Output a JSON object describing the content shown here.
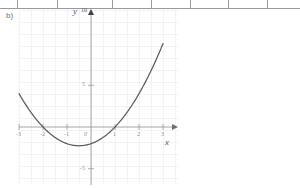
{
  "figure": {
    "part_label": "b)",
    "background_color": "#ffffff",
    "curve_color": "#5a5a62",
    "axis_color": "#9a9a9e",
    "grid_color": "#f2f2f5",
    "text_color": "#8b8b93"
  },
  "ruler": {
    "name": "page-ruler-strip",
    "tick_positions_px": [
      17,
      57,
      112,
      151,
      190,
      228,
      267
    ]
  },
  "axis_labels": {
    "x_name": "x",
    "y_name": "y",
    "y_max_label": "10",
    "origin_label": "0"
  },
  "chart_data": {
    "type": "line",
    "title": "b)",
    "xlabel": "x",
    "ylabel": "y",
    "xlim": [
      -3,
      3
    ],
    "ylim": [
      -5,
      10
    ],
    "grid": true,
    "legend": "none",
    "x_ticks": [
      -3,
      -2,
      -1,
      0,
      1,
      2,
      3
    ],
    "x_tick_labels": [
      "-3",
      "-2",
      "-1",
      "0",
      "1",
      "2",
      "3"
    ],
    "y_ticks": [
      -5,
      5,
      10
    ],
    "y_tick_labels": [
      "-5",
      "5",
      "10"
    ],
    "series": [
      {
        "name": "y = x^2 + x - 2",
        "equation": "y = x^2 + x - 2",
        "roots": [
          -2,
          1
        ],
        "vertex": [
          -0.5,
          -2.25
        ],
        "y_intercept": -2,
        "x": [
          -3.0,
          -2.75,
          -2.5,
          -2.25,
          -2.0,
          -1.75,
          -1.5,
          -1.25,
          -1.0,
          -0.75,
          -0.5,
          -0.25,
          0.0,
          0.25,
          0.5,
          0.75,
          1.0,
          1.25,
          1.5,
          1.75,
          2.0,
          2.25,
          2.5,
          2.75,
          3.0
        ],
        "y": [
          4.0,
          3.19,
          2.75,
          1.81,
          0.0,
          -0.69,
          -1.25,
          -1.69,
          -2.0,
          -2.19,
          -2.25,
          -2.19,
          -2.0,
          -1.69,
          -1.25,
          -0.69,
          0.0,
          0.81,
          1.75,
          2.81,
          4.0,
          5.31,
          6.75,
          8.31,
          10.0
        ]
      }
    ]
  }
}
